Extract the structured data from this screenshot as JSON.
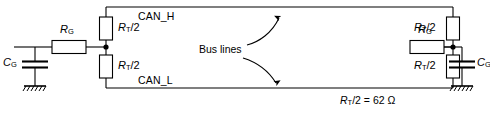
{
  "diagram": {
    "stroke_color": "#000000",
    "background_color": "#ffffff",
    "signals": {
      "can_high_label": "CAN_H",
      "can_low_label": "CAN_L"
    },
    "center_annotation": {
      "label": "Bus lines",
      "arrow_up_name": "curved-arrow-up-icon",
      "arrow_down_name": "curved-arrow-down-icon"
    },
    "equation": {
      "symbol": "R",
      "symbol_sub": "T",
      "divisor": "/2",
      "equals": " = ",
      "value": "62",
      "unit": "Ω",
      "full_text": "RT/2 = 62 Ω"
    },
    "left_network": {
      "series_resistor": {
        "symbol": "R",
        "sub": "G",
        "name": "resistor-rg-left"
      },
      "capacitor": {
        "symbol": "C",
        "sub": "G",
        "name": "capacitor-cg-left"
      },
      "termination_top": {
        "symbol": "R",
        "sub": "T",
        "suffix": "/2",
        "name": "resistor-rt2-top-left"
      },
      "termination_bottom": {
        "symbol": "R",
        "sub": "T",
        "suffix": "/2",
        "name": "resistor-rt2-bottom-left"
      },
      "ground_name": "ground-symbol-left"
    },
    "right_network": {
      "series_resistor": {
        "symbol": "R",
        "sub": "G",
        "name": "resistor-rg-right"
      },
      "capacitor": {
        "symbol": "C",
        "sub": "G",
        "name": "capacitor-cg-right"
      },
      "termination_top": {
        "symbol": "R",
        "sub": "T",
        "suffix": "/2",
        "name": "resistor-rt2-top-right"
      },
      "termination_bottom": {
        "symbol": "R",
        "sub": "T",
        "suffix": "/2",
        "name": "resistor-rt2-bottom-right"
      },
      "ground_name": "ground-symbol-right"
    }
  }
}
